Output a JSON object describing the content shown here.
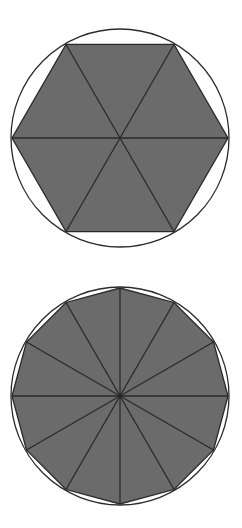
{
  "diagrams": [
    {
      "name": "hexagon-inscribed-in-circle",
      "sides": 6,
      "center": [
        120,
        138
      ],
      "radius": 108,
      "start_angle_deg": 0,
      "fill": "#6b6b6b",
      "stroke": "#2a2a2a",
      "circle_stroke": "#2a2a2a"
    },
    {
      "name": "dodecagon-inscribed-in-circle",
      "sides": 12,
      "center": [
        120,
        396
      ],
      "radius": 108,
      "start_angle_deg": 0,
      "fill": "#6b6b6b",
      "stroke": "#2a2a2a",
      "circle_stroke": "#2a2a2a"
    }
  ],
  "colors": {
    "background": "#ffffff",
    "polygon_fill": "#6b6b6b",
    "line": "#2a2a2a"
  }
}
